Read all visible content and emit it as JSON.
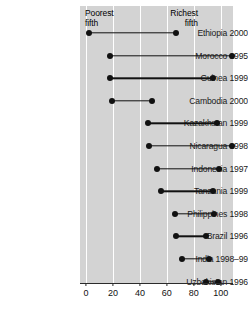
{
  "chart_data": {
    "type": "dumbbell",
    "title": "",
    "subtitle": "",
    "xlabel": "",
    "ylabel": "",
    "xlim": [
      0,
      100
    ],
    "xticks": [
      0,
      20,
      40,
      60,
      80,
      100
    ],
    "xticklabels": [
      "0",
      "20",
      "40",
      "60",
      "80",
      "100"
    ],
    "grid": "vertical-white-gridlines",
    "legend_position": "inside-top",
    "annotations": [
      {
        "name": "poorest-fifth-caption",
        "text": "Poorest\nfifth",
        "x": 3
      },
      {
        "name": "richest-fifth-caption",
        "text": "Richest\nfifth",
        "x": 67
      }
    ],
    "series": [
      {
        "name": "Poorest fifth",
        "values": [
          2,
          18,
          18,
          19,
          46,
          47,
          53,
          56,
          66,
          67,
          71,
          89
        ]
      },
      {
        "name": "Richest fifth",
        "values": [
          67,
          108,
          94,
          49,
          97,
          108,
          99,
          94,
          95,
          89,
          91,
          98
        ]
      }
    ],
    "categories": [
      "Ethiopia 2000",
      "Morocco 1995",
      "Guinea 1999",
      "Cambodia 2000",
      "Kazakhstan 1999",
      "Nicaragua 1998",
      "Indonesia 1997",
      "Tanzania 1999",
      "Philippines 1998",
      "Brazil 1996",
      "India 1998–99",
      "Uzbekistan 1996"
    ],
    "rows": [
      {
        "label": "Ethiopia 2000",
        "poorest": 2,
        "richest": 67
      },
      {
        "label": "Morocco 1995",
        "poorest": 18,
        "richest": 108
      },
      {
        "label": "Guinea 1999",
        "poorest": 18,
        "richest": 94
      },
      {
        "label": "Cambodia 2000",
        "poorest": 19,
        "richest": 49
      },
      {
        "label": "Kazakhstan 1999",
        "poorest": 46,
        "richest": 97
      },
      {
        "label": "Nicaragua 1998",
        "poorest": 47,
        "richest": 108
      },
      {
        "label": "Indonesia 1997",
        "poorest": 53,
        "richest": 99
      },
      {
        "label": "Tanzania 1999",
        "poorest": 56,
        "richest": 94
      },
      {
        "label": "Philippines 1998",
        "poorest": 66,
        "richest": 95
      },
      {
        "label": "Brazil 1996",
        "poorest": 67,
        "richest": 89
      },
      {
        "label": "India 1998–99",
        "poorest": 71,
        "richest": 91
      },
      {
        "label": "Uzbekistan 1996",
        "poorest": 89,
        "richest": 98
      }
    ],
    "colors": {
      "panel_background": "#d3d3d3",
      "gridline": "#ffffff",
      "marker": "#111111",
      "connector": "#111111",
      "axis": "#2b2b2b",
      "text": "#1a1a1a",
      "figure_background": "#ffffff"
    }
  }
}
